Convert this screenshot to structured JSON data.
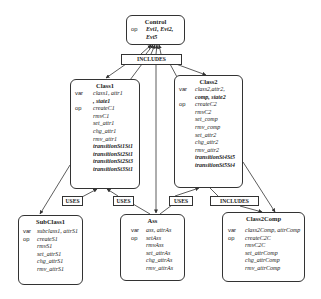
{
  "diagram": {
    "nodes": {
      "control": {
        "title": "Control",
        "op_kw": "op",
        "ops": [
          "Evt1, Evt2,",
          "Evt5"
        ]
      },
      "class1": {
        "title": "Class1",
        "var_kw": "var",
        "vars": [
          "class1, attr1",
          ", state1"
        ],
        "op_kw": "op",
        "ops": [
          "createC1",
          "rmvC1",
          "set_attr1",
          "chg_attr1",
          "rmv_attr1"
        ],
        "transitions": [
          "transitionSt1St1",
          "transitionSt2St1",
          "transitionSt2St3",
          "transitionSt3St1"
        ]
      },
      "class2": {
        "title": "Class2",
        "var_kw": "var",
        "vars": [
          "class2,attr2,",
          "comp, state2"
        ],
        "op_kw": "op",
        "ops": [
          "createC2",
          "rmvC2",
          "set_comp",
          "rmv_comp",
          "set_attr2",
          "chg_attr2",
          "rmv_attr2"
        ],
        "transitions": [
          "transitionSt4St5",
          "transitionSt5St4"
        ]
      },
      "subclass1": {
        "title": "SubClass1",
        "var_kw": "var",
        "vars": [
          "subclass1, attrS1"
        ],
        "op_kw": "op",
        "ops": [
          "createS1",
          "rmvS1",
          "set_attrS1",
          "chg_attrS1",
          "rmv_attrS1"
        ]
      },
      "ass": {
        "title": "Ass",
        "var_kw": "var",
        "vars": [
          "ass, attrAs"
        ],
        "op_kw": "op",
        "ops": [
          "setAss",
          "rmvAss",
          "set_attrAs",
          "chg_attrAs",
          "rmv_attrAs"
        ]
      },
      "class2comp": {
        "title": "Class2Comp",
        "var_kw": "var",
        "vars": [
          "class2Comp, attrComp"
        ],
        "op_kw": "op",
        "ops": [
          "createC2C",
          "rmvC2C",
          "set_attrComp",
          "chg_attrComp",
          "rmv_attrComp"
        ]
      }
    },
    "relations": {
      "includes_top": "INCLUDES",
      "uses_subclass1": "USES",
      "uses_ass_class1": "USES",
      "uses_ass_class2": "USES",
      "includes_class2comp": "INCLUDES"
    }
  }
}
